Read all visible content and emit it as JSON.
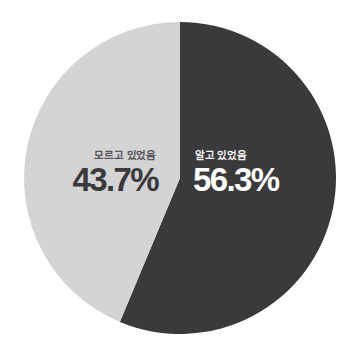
{
  "chart_data": {
    "type": "pie",
    "title": "",
    "subtitle": "",
    "xlabel": "",
    "ylabel": "",
    "legend_position": "on-slice",
    "grid": false,
    "categories": [
      "알고 있었음",
      "모르고 있었음"
    ],
    "values": [
      56.3,
      43.7
    ],
    "unit": "%",
    "slices": [
      {
        "label": "알고 있었음",
        "value": 56.3,
        "display_value": "56.3%",
        "color": "#3a3a3c",
        "text_color": "#ffffff",
        "start_angle_deg": 0,
        "end_angle_deg": 202.68
      },
      {
        "label": "모르고 있었음",
        "value": 43.7,
        "display_value": "43.7%",
        "color": "#d4d4d4",
        "text_color": "#3a3a3c",
        "start_angle_deg": 202.68,
        "end_angle_deg": 360
      }
    ],
    "start_angle_deg": 0,
    "direction": "clockwise",
    "total": 100.0,
    "background_color": "#ffffff"
  },
  "figure": {
    "background_color": "#ffffff",
    "center_x": 180,
    "center_y": 178,
    "radius": 156
  },
  "labels": {
    "left": {
      "category": "모르고 있었음",
      "percent": "43.7%"
    },
    "right": {
      "category": "알고 있었음",
      "percent": "56.3%"
    }
  }
}
